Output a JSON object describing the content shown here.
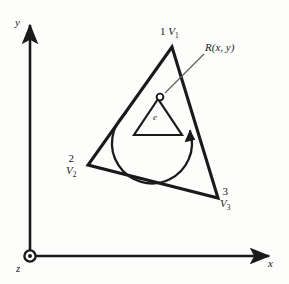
{
  "figure": {
    "type": "finite-element-triangle-diagram",
    "background_color": "#fdfdfc",
    "line_color": "#1a1a1a"
  },
  "axes": {
    "y_label": "y",
    "x_label": "x",
    "z_label": "z",
    "origin_symbol": "z-out-of-page-dot",
    "y_axis": {
      "x": 30,
      "top": 22,
      "bottom": 256
    },
    "x_axis": {
      "y": 256,
      "left": 30,
      "right": 272
    }
  },
  "element": {
    "element_label": "e",
    "rotation_direction": "counterclockwise",
    "triangle_vertices": [
      {
        "x": 172,
        "y": 47
      },
      {
        "x": 88,
        "y": 165
      },
      {
        "x": 218,
        "y": 198
      }
    ],
    "inner_triangle_vertices": [
      {
        "x": 158,
        "y": 99
      },
      {
        "x": 134,
        "y": 135
      },
      {
        "x": 182,
        "y": 135
      }
    ]
  },
  "nodes": [
    {
      "number": "1",
      "symbol": "V",
      "subscript": "1",
      "position": "apex-top"
    },
    {
      "number": "2",
      "symbol": "V",
      "subscript": "2",
      "position": "left-bottom"
    },
    {
      "number": "3",
      "symbol": "V",
      "subscript": "3",
      "position": "right-bottom"
    }
  ],
  "point_r": {
    "label": "R(x, y)",
    "marker": "open-circle",
    "marker_position": {
      "x": 160,
      "y": 97
    },
    "leader_line": {
      "x1": 166,
      "y1": 93,
      "x2": 203,
      "y2": 55
    }
  }
}
